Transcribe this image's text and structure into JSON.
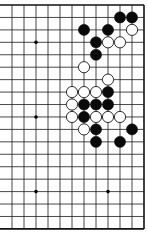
{
  "board": {
    "type": "go-diagram",
    "columns": 12,
    "rows": 19,
    "x0": 12,
    "dx": 12,
    "y0": 5,
    "dy": 12.44,
    "edges": [
      "top",
      "right",
      "bottom"
    ],
    "line_color": "#1a1a1a",
    "edge_color": "#111111",
    "stone_black": "#0a0a0a",
    "stone_white_fill": "#ffffff",
    "stone_white_stroke": "#1a1a1a",
    "star_points": [
      [
        2,
        3
      ],
      [
        2,
        9
      ],
      [
        2,
        15
      ],
      [
        8,
        15
      ]
    ],
    "stones": [
      {
        "c": "B",
        "col": 9,
        "row": 1
      },
      {
        "c": "B",
        "col": 10,
        "row": 1
      },
      {
        "c": "B",
        "col": 6,
        "row": 2
      },
      {
        "c": "B",
        "col": 8,
        "row": 2
      },
      {
        "c": "W",
        "col": 10,
        "row": 2
      },
      {
        "c": "B",
        "col": 7,
        "row": 3
      },
      {
        "c": "W",
        "col": 8,
        "row": 3
      },
      {
        "c": "W",
        "col": 9,
        "row": 3
      },
      {
        "c": "B",
        "col": 7,
        "row": 4
      },
      {
        "c": "W",
        "col": 6,
        "row": 5
      },
      {
        "c": "W",
        "col": 8,
        "row": 6
      },
      {
        "c": "W",
        "col": 5,
        "row": 7
      },
      {
        "c": "W",
        "col": 6,
        "row": 7
      },
      {
        "c": "W",
        "col": 7,
        "row": 7
      },
      {
        "c": "B",
        "col": 8,
        "row": 7
      },
      {
        "c": "W",
        "col": 5,
        "row": 8
      },
      {
        "c": "B",
        "col": 6,
        "row": 8
      },
      {
        "c": "B",
        "col": 7,
        "row": 8
      },
      {
        "c": "B",
        "col": 8,
        "row": 8
      },
      {
        "c": "W",
        "col": 5,
        "row": 9
      },
      {
        "c": "B",
        "col": 6,
        "row": 9
      },
      {
        "c": "W",
        "col": 7,
        "row": 9
      },
      {
        "c": "W",
        "col": 8,
        "row": 9
      },
      {
        "c": "W",
        "col": 9,
        "row": 9
      },
      {
        "c": "W",
        "col": 6,
        "row": 10
      },
      {
        "c": "B",
        "col": 7,
        "row": 10
      },
      {
        "c": "B",
        "col": 10,
        "row": 10
      },
      {
        "c": "B",
        "col": 7,
        "row": 11
      },
      {
        "c": "B",
        "col": 9,
        "row": 11
      }
    ]
  }
}
